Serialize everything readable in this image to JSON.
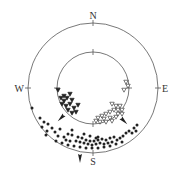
{
  "diagram": {
    "type": "stereonet-double-circle",
    "center": [
      93,
      88
    ],
    "outer_radius": 65,
    "inner_radius": 36,
    "line_color": "#555555",
    "marker_color": "#222222",
    "labels": {
      "north": "N",
      "south": "S",
      "east": "E",
      "west": "W"
    }
  },
  "markers": {
    "outer_dots": [
      [
        32,
        108
      ],
      [
        40,
        118
      ],
      [
        44,
        122
      ],
      [
        42,
        127
      ],
      [
        48,
        124
      ],
      [
        47,
        131
      ],
      [
        52,
        128
      ],
      [
        55,
        132
      ],
      [
        58,
        136
      ],
      [
        60,
        129
      ],
      [
        64,
        137
      ],
      [
        68,
        134
      ],
      [
        70,
        141
      ],
      [
        72,
        135
      ],
      [
        76,
        141
      ],
      [
        78,
        137
      ],
      [
        80,
        142
      ],
      [
        82,
        138
      ],
      [
        84,
        143
      ],
      [
        86,
        140
      ],
      [
        88,
        144
      ],
      [
        90,
        141
      ],
      [
        92,
        145
      ],
      [
        94,
        141
      ],
      [
        96,
        144
      ],
      [
        98,
        137
      ],
      [
        98,
        140
      ],
      [
        100,
        143
      ],
      [
        102,
        139
      ],
      [
        104,
        144
      ],
      [
        106,
        140
      ],
      [
        108,
        143
      ],
      [
        110,
        138
      ],
      [
        112,
        142
      ],
      [
        114,
        137
      ],
      [
        117,
        140
      ],
      [
        120,
        138
      ],
      [
        123,
        136
      ],
      [
        126,
        133
      ],
      [
        129,
        131
      ],
      [
        132,
        133
      ],
      [
        134,
        128
      ],
      [
        137,
        125
      ],
      [
        136,
        131
      ],
      [
        46,
        135
      ],
      [
        56,
        141
      ],
      [
        62,
        143
      ],
      [
        68,
        145
      ],
      [
        74,
        146
      ],
      [
        80,
        147
      ],
      [
        86,
        148
      ],
      [
        92,
        148
      ],
      [
        98,
        148
      ],
      [
        104,
        147
      ],
      [
        110,
        146
      ],
      [
        116,
        144
      ],
      [
        122,
        142
      ],
      [
        66,
        140
      ],
      [
        96,
        138
      ],
      [
        90,
        136
      ],
      [
        84,
        134
      ],
      [
        72,
        130
      ]
    ],
    "inner_filled_triangles": [
      [
        58,
        90
      ],
      [
        61,
        98
      ],
      [
        64,
        101
      ],
      [
        67,
        98
      ],
      [
        62,
        104
      ],
      [
        66,
        106
      ],
      [
        70,
        104
      ],
      [
        72,
        100
      ],
      [
        74,
        108
      ],
      [
        68,
        110
      ],
      [
        72,
        113
      ],
      [
        76,
        112
      ],
      [
        78,
        105
      ],
      [
        64,
        96
      ],
      [
        70,
        94
      ]
    ],
    "inner_open_triangles": [
      [
        126,
        82
      ],
      [
        128,
        86
      ],
      [
        124,
        90
      ],
      [
        112,
        104
      ],
      [
        116,
        106
      ],
      [
        120,
        106
      ],
      [
        114,
        110
      ],
      [
        118,
        110
      ],
      [
        122,
        110
      ],
      [
        110,
        112
      ],
      [
        106,
        114
      ],
      [
        102,
        116
      ],
      [
        98,
        118
      ],
      [
        104,
        119
      ],
      [
        110,
        118
      ],
      [
        116,
        117
      ],
      [
        96,
        121
      ],
      [
        100,
        122
      ],
      [
        106,
        122
      ],
      [
        112,
        121
      ],
      [
        118,
        114
      ],
      [
        122,
        114
      ]
    ],
    "mean_arrows": [
      {
        "x": 62,
        "y": 117,
        "angle": 225
      },
      {
        "x": 123,
        "y": 120,
        "angle": 135
      },
      {
        "x": 80,
        "y": 157,
        "angle": 180
      }
    ]
  }
}
